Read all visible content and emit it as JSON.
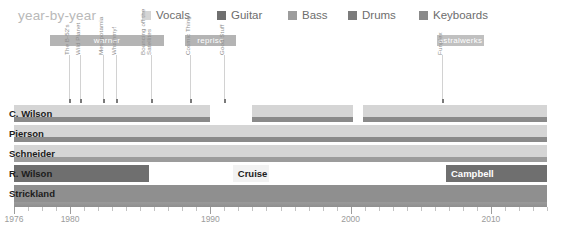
{
  "header": {
    "title": "year-by-year",
    "legend": [
      {
        "label": "Vocals",
        "color": "#d5d5d5",
        "x": 142
      },
      {
        "label": "Guitar",
        "color": "#6f6f6f",
        "x": 217
      },
      {
        "label": "Bass",
        "color": "#9c9c9c",
        "x": 288
      },
      {
        "label": "Drums",
        "color": "#7b7b7b",
        "x": 348
      },
      {
        "label": "Keyboards",
        "color": "#8a8a8a",
        "x": 419
      }
    ]
  },
  "eras": [
    {
      "name": "warner",
      "label": "warner",
      "x": 50,
      "w": 114,
      "color": "#b4b4b4"
    },
    {
      "name": "reprise",
      "label": "reprise",
      "x": 185,
      "w": 51,
      "color": "#b4b4b4"
    },
    {
      "name": "astralwerks",
      "label": "astralwerks",
      "x": 437,
      "w": 47,
      "color": "#c0c0c0"
    }
  ],
  "albums": [
    {
      "label": "The B-52's",
      "x": 69,
      "stem": 44,
      "year": 1979
    },
    {
      "label": "Wild Planet",
      "x": 80,
      "stem": 44,
      "year": 1980
    },
    {
      "label": "Mesopotamia",
      "x": 103,
      "stem": 44,
      "year": 1982
    },
    {
      "label": "Whammy!",
      "x": 116,
      "stem": 44,
      "year": 1983
    },
    {
      "label": "Bouncing off the\nSatellites",
      "x": 151,
      "stem": 44,
      "year": 1986
    },
    {
      "label": "Cosmic Thing",
      "x": 190,
      "stem": 44,
      "year": 1989
    },
    {
      "label": "Good Stuff",
      "x": 224,
      "stem": 44,
      "year": 1992
    },
    {
      "label": "Funplex",
      "x": 442,
      "stem": 44,
      "year": 2008
    }
  ],
  "chart_data": {
    "type": "timeline",
    "title": "year-by-year",
    "xlabel": "",
    "ylabel": "",
    "xlim": [
      1976,
      2014
    ],
    "tick_labels": [
      "1976",
      "1980",
      "1990",
      "2000",
      "2010"
    ],
    "tick_years": [
      1976,
      1980,
      1990,
      2000,
      2010
    ],
    "minor_tick_step": 1,
    "grid": true,
    "legend_position": "top",
    "members": [
      {
        "name": "C. Wilson",
        "label_x": 9,
        "spans": [
          {
            "role": "Vocals",
            "start": 1976,
            "end": 1990,
            "color": "#d5d5d5",
            "layer": "main"
          },
          {
            "role": "Vocals",
            "start": 1993,
            "end": 2000.2,
            "color": "#d5d5d5",
            "layer": "main"
          },
          {
            "role": "Vocals",
            "start": 2000.9,
            "end": 2014,
            "color": "#d5d5d5",
            "layer": "main"
          },
          {
            "role": "Keyboards",
            "start": 1976,
            "end": 1990,
            "color": "#8a8a8a",
            "layer": "sub"
          },
          {
            "role": "Keyboards",
            "start": 1993,
            "end": 2000.2,
            "color": "#8a8a8a",
            "layer": "sub"
          },
          {
            "role": "Keyboards",
            "start": 2000.9,
            "end": 2014,
            "color": "#8a8a8a",
            "layer": "sub"
          }
        ]
      },
      {
        "name": "Pierson",
        "label_x": 9,
        "spans": [
          {
            "role": "Vocals",
            "start": 1976,
            "end": 2014,
            "color": "#d5d5d5",
            "layer": "main"
          },
          {
            "role": "Keyboards",
            "start": 1976,
            "end": 2014,
            "color": "#8a8a8a",
            "layer": "sub"
          }
        ]
      },
      {
        "name": "Schneider",
        "label_x": 9,
        "spans": [
          {
            "role": "Vocals",
            "start": 1976,
            "end": 2014,
            "color": "#d5d5d5",
            "layer": "main"
          },
          {
            "role": "Bass",
            "start": 1976,
            "end": 2014,
            "color": "#9c9c9c",
            "layer": "sub"
          }
        ]
      },
      {
        "name": "R. Wilson",
        "label_x": 9,
        "spans": [
          {
            "role": "Guitar",
            "start": 1976,
            "end": 1985.6,
            "color": "#6f6f6f",
            "layer": "full"
          },
          {
            "role": "Guitar",
            "start": 1991.6,
            "end": 1994.2,
            "color": "#f2f2f2",
            "layer": "full",
            "label": "Cruise",
            "label_style": "onlight"
          },
          {
            "role": "Guitar",
            "start": 2006.8,
            "end": 2014,
            "color": "#6f6f6f",
            "layer": "full",
            "label": "Campbell",
            "label_style": "ondark"
          }
        ]
      },
      {
        "name": "Strickland",
        "label_x": 9,
        "spans": [
          {
            "role": "Drums",
            "start": 1976,
            "end": 2014,
            "color": "#8f8f8f",
            "layer": "full"
          }
        ]
      }
    ]
  }
}
